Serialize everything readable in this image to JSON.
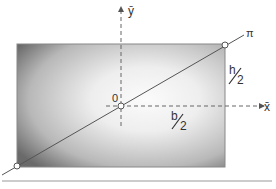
{
  "diagram": {
    "labels": {
      "y_axis": "ȳ",
      "x_axis": "x̄",
      "origin": "0",
      "line": "π",
      "half_height_num": "h",
      "half_height_den": "2",
      "half_width_num": "b",
      "half_width_den": "2"
    },
    "colors": {
      "rect_dark": "#6e6e6e",
      "rect_light": "#f4f4f4",
      "stroke": "#555555",
      "axis": "#666666",
      "baseline": "#999999"
    },
    "geometry": {
      "rect": {
        "x": 17,
        "y": 44,
        "width": 208,
        "height": 123
      },
      "origin": {
        "x": 121,
        "y": 106
      },
      "diagonal_start": {
        "x": 0,
        "y": 176
      },
      "diagonal_end": {
        "x": 244,
        "y": 34
      },
      "baseline_y": 181
    }
  }
}
